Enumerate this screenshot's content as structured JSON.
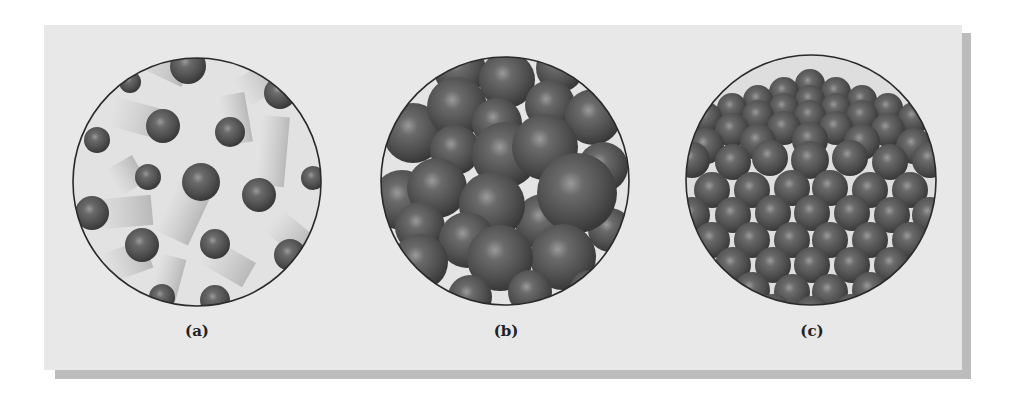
{
  "figure": {
    "panels": [
      {
        "id": "a",
        "label": "(a)",
        "state": "gas",
        "cx": 197,
        "cy": 182,
        "r": 124
      },
      {
        "id": "b",
        "label": "(b)",
        "state": "liquid",
        "cx": 505,
        "cy": 181,
        "r": 124
      },
      {
        "id": "c",
        "label": "(c)",
        "state": "solid",
        "cx": 811,
        "cy": 180,
        "r": 125
      }
    ],
    "colors": {
      "page_bg": "#ffffff",
      "panel_bg": "#e8e8e8",
      "panel_shadow": "#bcbcbc",
      "circle_bg": "#dcdcdc",
      "circle_border": "#2a2a2a",
      "sphere_dark": "#3e3e3e",
      "sphere_mid": "#565656",
      "sphere_highlight": "#9a9a9a",
      "trail": "#bdbdbd"
    }
  }
}
